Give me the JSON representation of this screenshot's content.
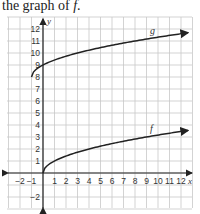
{
  "caption": {
    "prefix": "the graph of ",
    "fn": "f",
    "suffix": "."
  },
  "chart_data": {
    "type": "line",
    "title": "",
    "xlabel": "x",
    "ylabel": "y",
    "xlim": [
      -3,
      13
    ],
    "ylim": [
      -3,
      13
    ],
    "grid": true,
    "x_ticks": [
      -2,
      -1,
      1,
      2,
      3,
      4,
      5,
      6,
      7,
      8,
      9,
      10,
      11,
      12
    ],
    "y_ticks": [
      -2,
      1,
      2,
      3,
      4,
      5,
      6,
      7,
      8,
      9,
      10,
      11,
      12
    ],
    "series": [
      {
        "name": "f",
        "description": "square root curve starting at origin",
        "x": [
          0,
          1,
          2,
          3,
          4,
          6,
          8,
          10,
          12
        ],
        "values": [
          0,
          1,
          1.41,
          1.73,
          2,
          2.45,
          2.83,
          3.16,
          3.46
        ]
      },
      {
        "name": "g",
        "description": "square root curve starting near (-1, 8)",
        "x": [
          -1,
          0,
          1,
          2,
          3,
          4,
          6,
          8,
          10,
          12
        ],
        "values": [
          8,
          9,
          9.41,
          9.73,
          10,
          10.24,
          10.65,
          11,
          11.32,
          11.61
        ]
      }
    ]
  }
}
